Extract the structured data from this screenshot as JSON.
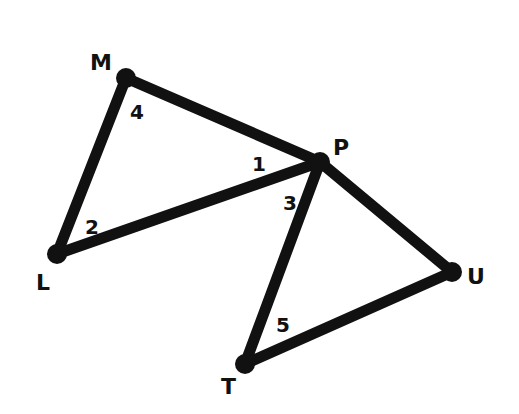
{
  "diagram": {
    "type": "geometry",
    "colors": {
      "stroke": "#111111",
      "background": "#ffffff"
    },
    "points": {
      "M": {
        "x": 126,
        "y": 78
      },
      "P": {
        "x": 320,
        "y": 162
      },
      "L": {
        "x": 57,
        "y": 254
      },
      "U": {
        "x": 452,
        "y": 272
      },
      "T": {
        "x": 245,
        "y": 364
      }
    },
    "segments": [
      {
        "name": "MP",
        "from": "M",
        "to": "P"
      },
      {
        "name": "ML",
        "from": "M",
        "to": "L"
      },
      {
        "name": "LP",
        "from": "L",
        "to": "P"
      },
      {
        "name": "PT",
        "from": "P",
        "to": "T"
      },
      {
        "name": "PU",
        "from": "P",
        "to": "U"
      },
      {
        "name": "TU",
        "from": "T",
        "to": "U"
      }
    ],
    "vertex_labels": {
      "M": "M",
      "P": "P",
      "L": "L",
      "U": "U",
      "T": "T"
    },
    "angle_labels": {
      "a1": "1",
      "a2": "2",
      "a3": "3",
      "a4": "4",
      "a5": "5"
    },
    "triangles": [
      "LMP",
      "PTU"
    ]
  }
}
